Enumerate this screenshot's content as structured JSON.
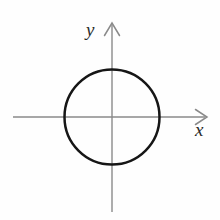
{
  "figure": {
    "background_color": "#fefefe",
    "width": 220,
    "height": 220
  },
  "axes": {
    "x_axis": {
      "label": "x",
      "color": "#8a8a8a",
      "stroke_width": 1.4,
      "start_x": 13,
      "end_x": 207,
      "y": 117,
      "arrow": "open-v-right",
      "label_x": 195,
      "label_y": 120
    },
    "y_axis": {
      "label": "y",
      "color": "#8a8a8a",
      "stroke_width": 1.4,
      "x": 112,
      "start_y": 212,
      "end_y": 23,
      "arrow": "open-v-up",
      "label_x": 86,
      "label_y": 20
    },
    "origin": {
      "x": 112,
      "y": 117
    }
  },
  "shapes": [
    {
      "name": "circle",
      "type": "circle",
      "center_x": 112,
      "center_y": 117,
      "radius": 47.5,
      "stroke_color": "#161616",
      "stroke_width": 2.5,
      "fill": "none"
    }
  ],
  "chart_data": {
    "type": "scatter",
    "xlabel": "x",
    "ylabel": "y",
    "grid": false,
    "legend": null,
    "xlim": [
      -1.6,
      1.6
    ],
    "ylim": [
      -1.6,
      1.6
    ],
    "xticks": [],
    "yticks": [],
    "annotations": [],
    "series": [
      {
        "name": "circle",
        "type": "circle",
        "center": [
          0,
          0
        ],
        "radius": 1,
        "equation": "x^2 + y^2 = 1",
        "stroke_color": "#161616",
        "fill": "none"
      }
    ]
  }
}
